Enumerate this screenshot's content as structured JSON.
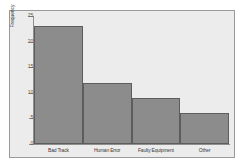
{
  "chart_data": {
    "type": "bar",
    "title": "",
    "subtitle": "",
    "xlabel": "",
    "ylabel": "Frequency",
    "categories": [
      "Bad Track",
      "Human Error",
      "Faulty Equipment",
      "Other"
    ],
    "values": [
      23,
      12,
      9,
      6
    ],
    "series": [
      {
        "name": "Frequency",
        "values": [
          23,
          12,
          9,
          6
        ]
      }
    ],
    "ylim": [
      0,
      25
    ],
    "yticks": [
      0,
      5,
      10,
      15,
      20,
      25
    ],
    "ytick_labels": [
      "0",
      "5",
      "10",
      "15",
      "20",
      "25"
    ],
    "grid": false,
    "legend": false,
    "legend_position": "none",
    "annotations": [],
    "colors": {
      "bar_fill": "#8c8c8c",
      "bar_edge": "#5d5d5d",
      "plot_background": "#ececec",
      "figure_background": "#ffffff",
      "axis_line": "#8e8e8e",
      "frame_border": "#9a9a9a",
      "tick_label": "#555555",
      "axis_title": "#3a3a3a"
    }
  }
}
